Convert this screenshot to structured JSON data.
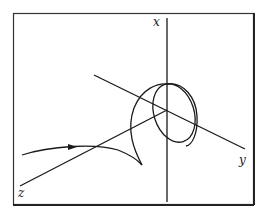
{
  "diagram": {
    "type": "3d-axes-trajectory",
    "axes": {
      "x": {
        "label": "x"
      },
      "y": {
        "label": "y"
      },
      "z": {
        "label": "z"
      }
    },
    "colors": {
      "stroke": "#1a1a1a",
      "frame": "#333333",
      "background": "#ffffff"
    },
    "trajectory": {
      "description": "Incoming curve with direction arrow, cusp, then spiraling into an elliptical loop around the x axis"
    }
  }
}
